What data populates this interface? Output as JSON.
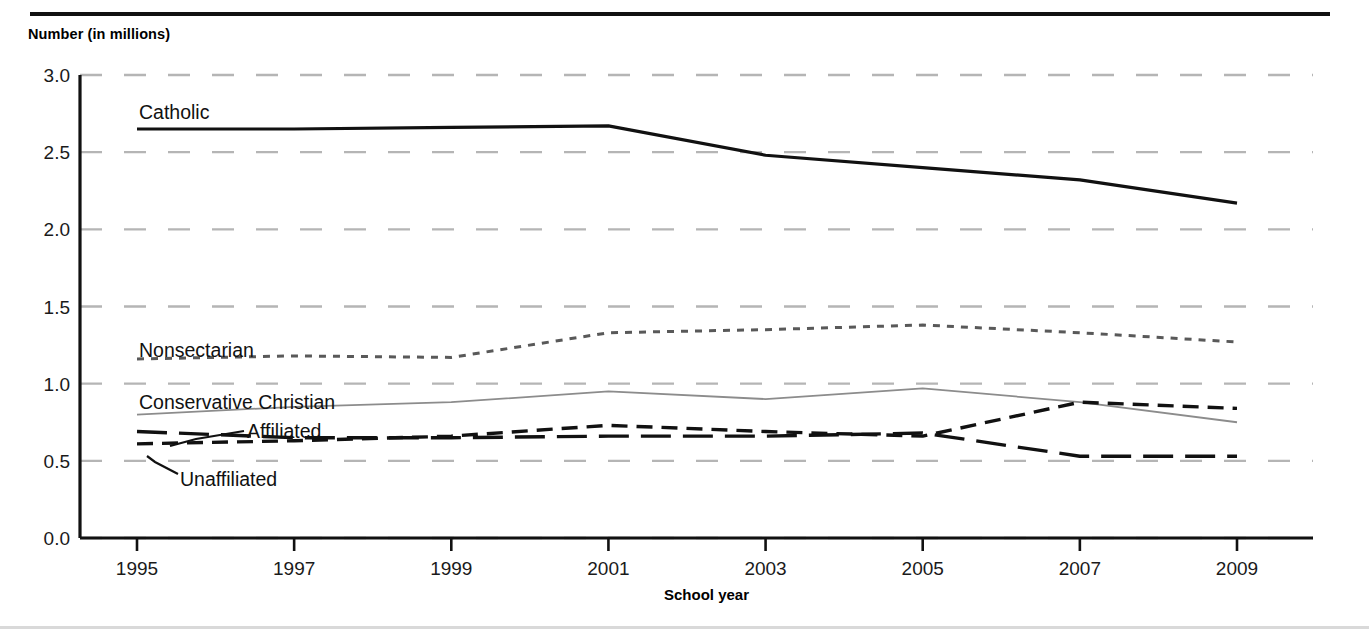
{
  "figure": {
    "y_axis_title": "Number (in millions)",
    "x_axis_title": "School year",
    "top_clipped_text": "",
    "colors": {
      "catholic": "#111111",
      "nonsectarian": "#595959",
      "conservative_christian": "#8c8c8c",
      "affiliated": "#111111",
      "unaffiliated": "#111111",
      "gridline": "#b5b5b5",
      "axis": "#111111"
    }
  },
  "chart_data": {
    "type": "line",
    "title": "",
    "subtitle": "",
    "xlabel": "School year",
    "ylabel": "Number (in millions)",
    "xlim": [
      1995,
      2010
    ],
    "ylim": [
      0.0,
      3.0
    ],
    "ytick_labels": [
      "0.0",
      "0.5",
      "1.0",
      "1.5",
      "2.0",
      "2.5",
      "3.0"
    ],
    "yticks": [
      0.0,
      0.5,
      1.0,
      1.5,
      2.0,
      2.5,
      3.0
    ],
    "xtick_labels": [
      "1995",
      "1997",
      "1999",
      "2001",
      "2003",
      "2005",
      "2007",
      "2009"
    ],
    "xticks": [
      1995,
      1997,
      1999,
      2001,
      2003,
      2005,
      2007,
      2009
    ],
    "grid": true,
    "grid_style": "dashed-horizontal",
    "legend_position": "inline-labels",
    "x": [
      1995,
      1997,
      1999,
      2001,
      2003,
      2005,
      2007,
      2009
    ],
    "series": [
      {
        "name": "Catholic",
        "label": "Catholic",
        "line_style": "solid",
        "line_width": 3.2,
        "color": "#111111",
        "values": [
          2.65,
          2.65,
          2.66,
          2.67,
          2.48,
          2.4,
          2.32,
          2.17
        ]
      },
      {
        "name": "Nonsectarian",
        "label": "Nonsectarian",
        "line_style": "dotted",
        "line_width": 3.0,
        "color": "#595959",
        "values": [
          1.16,
          1.18,
          1.17,
          1.33,
          1.35,
          1.38,
          1.33,
          1.27
        ]
      },
      {
        "name": "Conservative Christian",
        "label": "Conservative Christian",
        "line_style": "thin-solid",
        "line_width": 1.8,
        "color": "#8c8c8c",
        "values": [
          0.8,
          0.85,
          0.88,
          0.95,
          0.9,
          0.97,
          0.88,
          0.75
        ]
      },
      {
        "name": "Affiliated",
        "label": "Affiliated",
        "line_style": "long-dash",
        "line_width": 3.4,
        "color": "#111111",
        "values": [
          0.69,
          0.65,
          0.65,
          0.66,
          0.66,
          0.68,
          0.53,
          0.53
        ]
      },
      {
        "name": "Unaffiliated",
        "label": "Unaffiliated",
        "line_style": "dash",
        "line_width": 3.4,
        "color": "#111111",
        "values": [
          0.61,
          0.63,
          0.66,
          0.73,
          0.69,
          0.66,
          0.88,
          0.84
        ]
      }
    ]
  }
}
